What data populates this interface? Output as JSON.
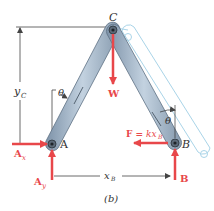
{
  "figure": {
    "caption": "(b)",
    "points": {
      "A": "A",
      "B": "B",
      "C": "C"
    },
    "dimensions": {
      "height": "y",
      "height_sub": "C",
      "width": "x",
      "width_sub": "B"
    },
    "angles": {
      "left": "θ",
      "right": "θ"
    },
    "forces": {
      "weight": "W",
      "ax": "A",
      "ax_sub": "x",
      "ay": "A",
      "ay_sub": "y",
      "b": "B",
      "spring_prefix": "F = ",
      "spring_k": "kx",
      "spring_sub": "B"
    },
    "colors": {
      "force": "#e8474a",
      "member": "#9fb3c8",
      "member_dark": "#6d8296",
      "ghost": "#a9d4e8",
      "dim": "#444444"
    }
  }
}
